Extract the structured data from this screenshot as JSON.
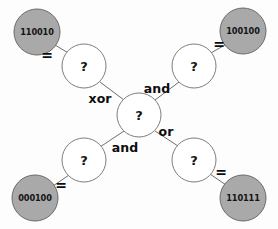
{
  "diagram": {
    "type": "constraint-graph",
    "unknown_symbol": "?",
    "equality_symbol": "=",
    "colors": {
      "given_node_fill": "#a9a9a9",
      "given_node_stroke": "#6a6a6a",
      "unknown_node_fill": "#ffffff",
      "unknown_node_stroke": "#7d7d7d",
      "edge_stroke": "#6e6e6e",
      "text": "#141414",
      "background": "#fdfdfd"
    },
    "given_nodes": [
      {
        "id": "given-top-left",
        "value": "110010",
        "cx": 37,
        "cy": 32,
        "r": 23
      },
      {
        "id": "given-top-right",
        "value": "100100",
        "cx": 243,
        "cy": 31,
        "r": 23
      },
      {
        "id": "given-bottom-left",
        "value": "000100",
        "cx": 35,
        "cy": 198,
        "r": 23
      },
      {
        "id": "given-bottom-right",
        "value": "110111",
        "cx": 243,
        "cy": 198,
        "r": 23
      }
    ],
    "unknown_nodes": [
      {
        "id": "unknown-upper-left",
        "label": "?",
        "cx": 84,
        "cy": 66,
        "r": 22
      },
      {
        "id": "unknown-upper-right",
        "label": "?",
        "cx": 194,
        "cy": 66,
        "r": 22
      },
      {
        "id": "unknown-center",
        "label": "?",
        "cx": 139,
        "cy": 115,
        "r": 22
      },
      {
        "id": "unknown-lower-left",
        "label": "?",
        "cx": 84,
        "cy": 160,
        "r": 22
      },
      {
        "id": "unknown-lower-right",
        "label": "?",
        "cx": 194,
        "cy": 160,
        "r": 22
      }
    ],
    "equality_edges": [
      {
        "id": "eq-top-left",
        "label": "=",
        "x1": 55,
        "y1": 45,
        "x2": 70,
        "y2": 54,
        "lx": 47,
        "ly": 60
      },
      {
        "id": "eq-top-right",
        "label": "=",
        "x1": 225,
        "y1": 45,
        "x2": 209,
        "y2": 54,
        "lx": 219,
        "ly": 49
      },
      {
        "id": "eq-bottom-left",
        "label": "=",
        "x1": 53,
        "y1": 186,
        "x2": 69,
        "y2": 175,
        "lx": 61,
        "ly": 190
      },
      {
        "id": "eq-bottom-right",
        "label": "=",
        "x1": 226,
        "y1": 185,
        "x2": 210,
        "y2": 174,
        "lx": 221,
        "ly": 177
      }
    ],
    "operator_edges": [
      {
        "id": "op-xor",
        "label": "xor",
        "x1": 100,
        "y1": 82,
        "x2": 124,
        "y2": 100,
        "lx": 100,
        "ly": 103
      },
      {
        "id": "op-and-upper",
        "label": "and",
        "x1": 155,
        "y1": 100,
        "x2": 179,
        "y2": 82,
        "lx": 157,
        "ly": 93
      },
      {
        "id": "op-and-lower",
        "label": "and",
        "x1": 124,
        "y1": 131,
        "x2": 100,
        "y2": 147,
        "lx": 125,
        "ly": 152
      },
      {
        "id": "op-or",
        "label": "or",
        "x1": 155,
        "y1": 131,
        "x2": 178,
        "y2": 146,
        "lx": 166,
        "ly": 136
      }
    ]
  }
}
